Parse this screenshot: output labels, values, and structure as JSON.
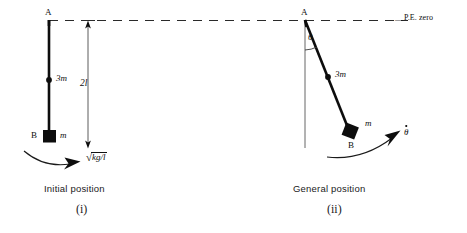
{
  "figure": {
    "background_color": "#ffffff",
    "ink_color": "#0d0d0d",
    "width": 467,
    "height": 233
  },
  "reference_line": {
    "name": "potential-energy-datum",
    "style": "dashed",
    "label": "P.E. zero",
    "y": 20
  },
  "panel_left": {
    "id": "i",
    "caption": "Initial position",
    "roman_numeral": "(i)",
    "pivot_label": "A",
    "mass_upper_label": "3m",
    "mass_lower_label": "m",
    "mass_lower_point_label": "B",
    "dimension_label": "2l",
    "velocity_label": {
      "radical": "√",
      "radicand": "kg/l"
    }
  },
  "panel_right": {
    "id": "ii",
    "caption": "General position",
    "roman_numeral": "(ii)",
    "pivot_label": "A",
    "angle_label": "θ",
    "mass_upper_label": "3m",
    "mass_lower_label": "m",
    "mass_lower_point_label": "B",
    "angular_velocity_label": "θ"
  }
}
